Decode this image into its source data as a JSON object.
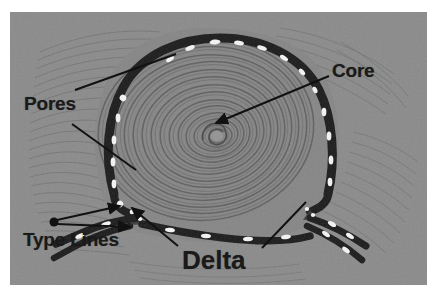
{
  "figure": {
    "background_color": "#ffffff",
    "photo_background_color": "#8b8b8b",
    "ridge_color": "#1c1c1c",
    "pore_color": "#f2f2f2",
    "annotation_color": "#1a1a1a"
  },
  "labels": {
    "pores": "Pores",
    "core": "Core",
    "type_lines": "Type Lines",
    "delta": "Delta"
  },
  "annotations": [
    {
      "name": "pores-upper-leader",
      "label": "Pores",
      "points": "75,90 175,54"
    },
    {
      "name": "pores-lower-leader",
      "label": "Pores",
      "points": "72,124 133,167"
    },
    {
      "name": "core-leader",
      "label": "Core",
      "points": "329,76 214,123"
    },
    {
      "name": "type-lines-leader-upper",
      "label": "Type Lines",
      "points": "54,222 124,206"
    },
    {
      "name": "type-lines-leader-lower",
      "label": "Type Lines",
      "points": "54,222 133,226"
    },
    {
      "name": "delta-left-leader",
      "label": "Delta",
      "points": "176,246 128,209"
    },
    {
      "name": "delta-right-leader",
      "label": "Delta",
      "points": "258,248 303,200"
    }
  ],
  "features": {
    "core_position": "center of the whorl",
    "delta_count": 2,
    "pattern_type": "whorl"
  }
}
